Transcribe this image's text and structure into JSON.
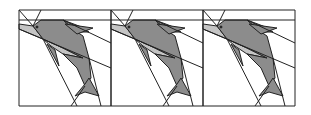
{
  "figure": {
    "panel_count": 3,
    "panels": [
      {
        "id": 1,
        "left": 19
      },
      {
        "id": 2,
        "left": 111
      },
      {
        "id": 3,
        "left": 203
      }
    ],
    "colors": {
      "stroke": "#222222",
      "dark_fill": "#8c8c8c",
      "light_fill": "#c4c4c4",
      "background": "#ffffff"
    }
  }
}
